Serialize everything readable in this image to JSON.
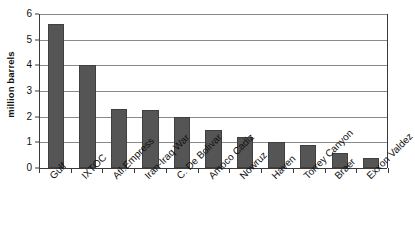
{
  "chart_data": {
    "type": "bar",
    "title": "",
    "xlabel": "",
    "ylabel": "million barrels",
    "ylim": [
      0,
      6
    ],
    "ytick_labels": [
      "0",
      "1",
      "2",
      "3",
      "4",
      "5",
      "6"
    ],
    "yticks": [
      0,
      1,
      2,
      3,
      4,
      5,
      6
    ],
    "grid": true,
    "legend": "none",
    "categories": [
      "Gulf",
      "IXTOC",
      "Atl.Empress",
      "Iran-Iraq War",
      "C. De Bolivar",
      "Amoco Cadiz",
      "Nowruz",
      "Haven",
      "Torrey Canyon",
      "Braer",
      "Exxon Valdez"
    ],
    "values": [
      5.6,
      4.0,
      2.3,
      2.25,
      2.0,
      1.5,
      1.2,
      1.0,
      0.9,
      0.6,
      0.38
    ],
    "bar_color": "#555555",
    "gridline_color": "#8a8a8a",
    "axis_color": "#3a3a3a"
  }
}
